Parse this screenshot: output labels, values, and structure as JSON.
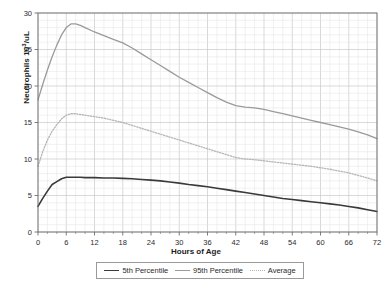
{
  "chart_data": {
    "type": "line",
    "title": "",
    "xlabel": "Hours of Age",
    "ylabel_text": "Neutrophils 10",
    "ylabel_sup": "3",
    "ylabel_tail": "/uL",
    "ylabel_full": "Neutrophils 10³/uL",
    "xlim": [
      0,
      72
    ],
    "ylim": [
      0,
      30
    ],
    "xticks": [
      0,
      6,
      12,
      18,
      24,
      30,
      36,
      42,
      48,
      54,
      60,
      66,
      72
    ],
    "yticks": [
      0,
      5,
      10,
      15,
      20,
      25,
      30
    ],
    "xtick_labels": [
      "0",
      "6",
      "12",
      "18",
      "24",
      "30",
      "36",
      "42",
      "48",
      "54",
      "60",
      "66",
      "72"
    ],
    "ytick_labels": [
      "0",
      "5",
      "10",
      "15",
      "20",
      "25",
      "30"
    ],
    "grid": true,
    "grid_minor_x_step": 2,
    "grid_minor_y_step": 1,
    "legend_position": "bottom",
    "colors": {
      "p5": "#3a3a3a",
      "p95": "#9a9a9a",
      "average": "#b5b5b5",
      "grid_major": "#c9c9c9",
      "grid_minor": "#e3e3e3",
      "axis": "#6e6e6e"
    },
    "x": [
      0,
      1,
      2,
      3,
      4,
      5,
      6,
      7,
      8,
      9,
      10,
      12,
      14,
      16,
      18,
      20,
      22,
      24,
      26,
      28,
      30,
      32,
      34,
      36,
      38,
      40,
      42,
      44,
      46,
      48,
      50,
      52,
      54,
      56,
      58,
      60,
      62,
      64,
      66,
      68,
      70,
      72
    ],
    "series": [
      {
        "name": "5th Percentile",
        "style": "solid",
        "color": "#3a3a3a",
        "width": 1.6,
        "values": [
          3.5,
          4.6,
          5.6,
          6.5,
          6.9,
          7.3,
          7.5,
          7.5,
          7.5,
          7.5,
          7.45,
          7.45,
          7.4,
          7.4,
          7.35,
          7.3,
          7.2,
          7.1,
          7.0,
          6.85,
          6.7,
          6.5,
          6.35,
          6.2,
          6.0,
          5.8,
          5.6,
          5.4,
          5.2,
          5.0,
          4.8,
          4.6,
          4.45,
          4.3,
          4.15,
          4.0,
          3.85,
          3.7,
          3.5,
          3.3,
          3.05,
          2.8
        ]
      },
      {
        "name": "95th Percentile",
        "style": "solid",
        "color": "#9a9a9a",
        "width": 1.3,
        "values": [
          18.1,
          20.2,
          22.2,
          24.0,
          25.6,
          27.0,
          28.0,
          28.5,
          28.5,
          28.3,
          28.0,
          27.4,
          26.9,
          26.4,
          25.9,
          25.2,
          24.4,
          23.6,
          22.8,
          22.0,
          21.2,
          20.5,
          19.8,
          19.1,
          18.4,
          17.8,
          17.3,
          17.1,
          17.0,
          16.8,
          16.5,
          16.2,
          15.9,
          15.6,
          15.3,
          15.0,
          14.7,
          14.4,
          14.1,
          13.7,
          13.3,
          12.8
        ]
      },
      {
        "name": "Average",
        "style": "dotted",
        "color": "#b5b5b5",
        "width": 1.3,
        "values": [
          9.0,
          11.0,
          12.6,
          13.8,
          14.7,
          15.5,
          16.0,
          16.2,
          16.2,
          16.1,
          16.0,
          15.8,
          15.6,
          15.3,
          15.0,
          14.6,
          14.2,
          13.8,
          13.4,
          13.0,
          12.6,
          12.2,
          11.8,
          11.4,
          11.0,
          10.6,
          10.2,
          10.0,
          9.9,
          9.75,
          9.6,
          9.45,
          9.3,
          9.15,
          9.0,
          8.8,
          8.6,
          8.35,
          8.1,
          7.75,
          7.4,
          7.0
        ]
      }
    ],
    "legend": [
      {
        "label": "5th Percentile",
        "style": "solid",
        "color": "#3a3a3a"
      },
      {
        "label": "95th Percentile",
        "style": "solid",
        "color": "#9a9a9a"
      },
      {
        "label": "Average",
        "style": "dotted",
        "color": "#b5b5b5"
      }
    ]
  }
}
